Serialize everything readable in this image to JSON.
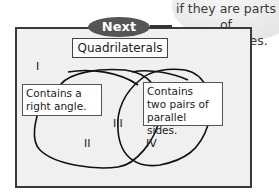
{
  "tip_bubble": {
    "line1": "if they are parts of",
    "line2": "parallel lines."
  },
  "header_tab": {
    "label": "Next",
    "color": "#555555"
  },
  "diagram": {
    "title": "Quadrilaterals",
    "set_left_label_line1": "Contains a",
    "set_left_label_line2": "right angle.",
    "set_right_label_line1": "Contains",
    "set_right_label_line2": "two pairs of",
    "set_right_label_line3": "parallel sides.",
    "regions": [
      "I",
      "II",
      "III",
      "IV"
    ]
  }
}
